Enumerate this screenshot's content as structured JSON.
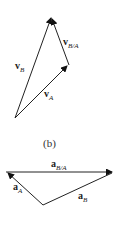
{
  "diagram_a": {
    "vectors": [
      {
        "name": "v",
        "sub": "B"
      },
      {
        "name": "v",
        "sub": "B/A"
      },
      {
        "name": "v",
        "sub": "A"
      }
    ]
  },
  "caption": "(b)",
  "diagram_b": {
    "vectors": [
      {
        "name": "a",
        "sub": "B/A"
      },
      {
        "name": "a",
        "sub": "A"
      },
      {
        "name": "a",
        "sub": "B"
      }
    ]
  }
}
